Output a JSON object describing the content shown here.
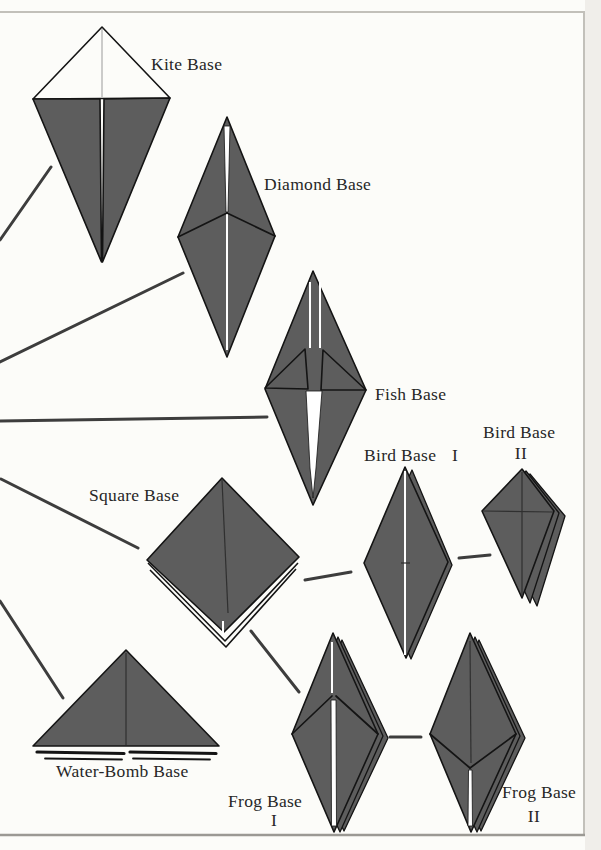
{
  "nodes": [
    {
      "id": "kite-base",
      "label": "Kite Base"
    },
    {
      "id": "diamond-base",
      "label": "Diamond Base"
    },
    {
      "id": "fish-base",
      "label": "Fish Base"
    },
    {
      "id": "bird-base-i",
      "label": "Bird Base",
      "numeral": "I"
    },
    {
      "id": "bird-base-ii",
      "label": "Bird Base",
      "numeral": "II"
    },
    {
      "id": "square-base",
      "label": "Square Base"
    },
    {
      "id": "water-bomb-base",
      "label": "Water-Bomb Base"
    },
    {
      "id": "frog-base-i",
      "label": "Frog Base",
      "numeral": "I"
    },
    {
      "id": "frog-base-ii",
      "label": "Frog Base",
      "numeral": "II"
    }
  ],
  "edges": [
    {
      "from": "off-page-trunk",
      "to": "kite-base"
    },
    {
      "from": "off-page-trunk",
      "to": "diamond-base"
    },
    {
      "from": "off-page-trunk",
      "to": "fish-base"
    },
    {
      "from": "off-page-trunk",
      "to": "square-base"
    },
    {
      "from": "off-page-trunk",
      "to": "water-bomb-base"
    },
    {
      "from": "square-base",
      "to": "bird-base-i"
    },
    {
      "from": "bird-base-i",
      "to": "bird-base-ii"
    },
    {
      "from": "square-base",
      "to": "frog-base-i"
    },
    {
      "from": "frog-base-i",
      "to": "frog-base-ii"
    }
  ],
  "colors": {
    "paper": "#fcfcf9",
    "paper-edge": "#f0eeea",
    "shape": "#5d5d5d",
    "ink": "#141414",
    "crease": "#303030",
    "label": "#272727",
    "connector": "#3d3d3d",
    "frame": "#c2c0ba",
    "sliver": "#ffffff"
  }
}
